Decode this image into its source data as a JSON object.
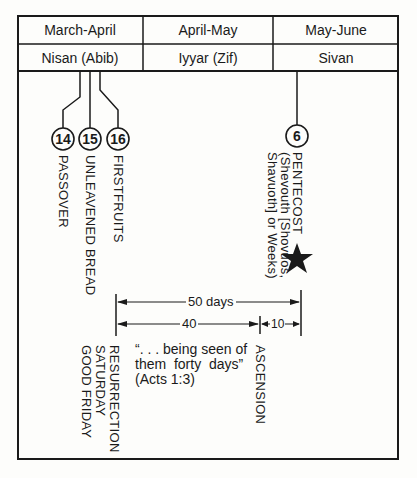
{
  "table": {
    "months": [
      "March-April",
      "April-May",
      "May-June"
    ],
    "hebrew_months": [
      "Nisan (Abib)",
      "Iyyar (Zif)",
      "Sivan"
    ]
  },
  "feasts": [
    {
      "day": "14",
      "label": "PASSOVER"
    },
    {
      "day": "15",
      "label": "UNLEAVENED BREAD"
    },
    {
      "day": "16",
      "label": "FIRSTFRUITS"
    },
    {
      "day": "6",
      "label": "PENTECOST",
      "note_line1": "(Shevouth [Shovuos,",
      "note_line2": "Shavuoth] or Weeks)",
      "marker": "star-icon"
    }
  ],
  "spans": {
    "total": "50 days",
    "first": "40",
    "second": "10"
  },
  "events": {
    "resurrection": "RESURRECTION",
    "saturday": "SATURDAY",
    "good_friday": "GOOD FRIDAY",
    "ascension": "ASCENSION"
  },
  "quote": {
    "line1": "“. . . being seen of",
    "line2": "them  forty  days”",
    "line3": "(Acts 1:3)"
  },
  "colors": {
    "ink": "#1a1a1a",
    "paper": "#fdfdfb"
  }
}
